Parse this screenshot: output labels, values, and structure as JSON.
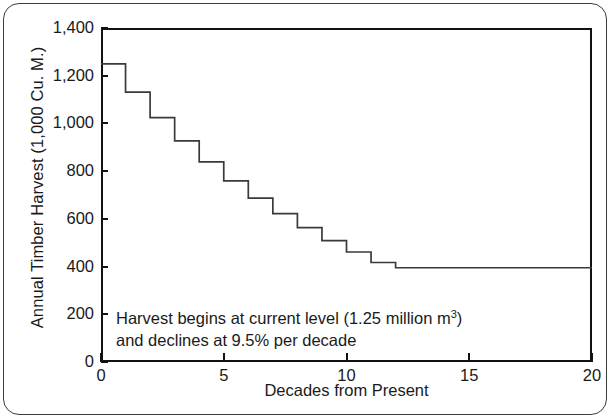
{
  "chart_data": {
    "type": "line",
    "subtype": "step-post",
    "title": "",
    "subtitle": "",
    "xlabel": "Decades from Present",
    "ylabel": "Annual Timber Harvest (1,000 Cu. M.)",
    "xlim": [
      0,
      20
    ],
    "ylim": [
      0,
      1400
    ],
    "grid": false,
    "legend": null,
    "x_ticks": [
      0,
      5,
      10,
      15,
      20
    ],
    "x_tick_labels": [
      "0",
      "5",
      "10",
      "15",
      "20"
    ],
    "y_ticks": [
      0,
      200,
      400,
      600,
      800,
      1000,
      1200,
      1400
    ],
    "y_tick_labels": [
      "0",
      "200",
      "400",
      "600",
      "800",
      "1,000",
      "1,200",
      "1,400"
    ],
    "x": [
      0,
      1,
      2,
      3,
      4,
      5,
      6,
      7,
      8,
      9,
      10,
      11,
      12,
      13,
      14,
      15,
      16,
      17,
      18,
      19,
      20
    ],
    "values": [
      1250,
      1131,
      1024,
      927,
      839,
      759,
      687,
      622,
      563,
      509,
      461,
      417,
      395,
      395,
      395,
      395,
      395,
      395,
      395,
      395,
      395
    ],
    "series": [
      {
        "name": "Annual Timber Harvest",
        "values": [
          1250,
          1131,
          1024,
          927,
          839,
          759,
          687,
          622,
          563,
          509,
          461,
          417,
          395,
          395,
          395,
          395,
          395,
          395,
          395,
          395,
          395
        ],
        "color": "#3a3a3a"
      }
    ],
    "annotations": [
      {
        "name": "harvest-decline-note",
        "line1_prefix": "Harvest begins at current level (1.25 million m",
        "line1_superscript": "3",
        "line1_suffix": ")",
        "line2": "and declines at 9.5% per decade",
        "x": 0.6,
        "y": 150
      }
    ],
    "floor_value": 395,
    "decline_rate_percent": 9.5,
    "start_value": 1250
  },
  "colors": {
    "line": "#3a3a3a",
    "axis": "#121212",
    "frame": "#3d3d3d",
    "text": "#1a1a1a",
    "background": "#ffffff"
  }
}
